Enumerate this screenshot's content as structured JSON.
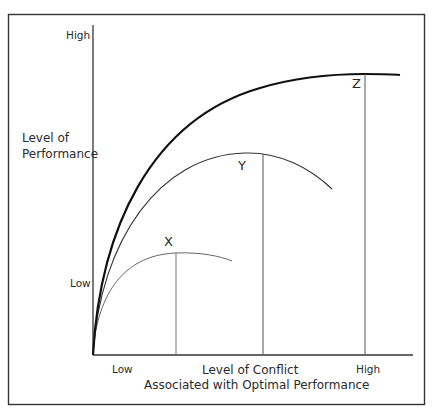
{
  "diagram": {
    "y_axis": {
      "title_line1": "Level of",
      "title_line2": "Performance",
      "high_label": "High",
      "low_label": "Low"
    },
    "x_axis": {
      "low_label": "Low",
      "high_label": "High",
      "title_line1": "Level of Conflict",
      "title_line2": "Associated with Optimal Performance"
    },
    "curves": [
      {
        "id": "X",
        "label": "X",
        "peak_conflict": "low-moderate",
        "stroke": "#555555"
      },
      {
        "id": "Y",
        "label": "Y",
        "peak_conflict": "moderate-high",
        "stroke": "#333333"
      },
      {
        "id": "Z",
        "label": "Z",
        "peak_conflict": "high",
        "stroke": "#111111"
      }
    ],
    "colors": {
      "frame": "#333333",
      "axis": "#333333",
      "background": "#ffffff"
    }
  }
}
